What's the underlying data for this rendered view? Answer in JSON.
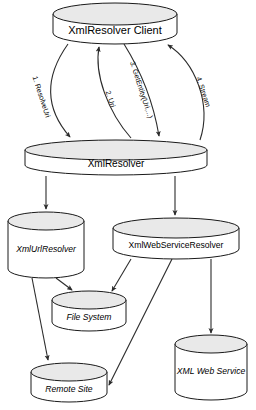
{
  "diagram": {
    "colors": {
      "cylinder_top_fill": "#e9e9e9",
      "cylinder_body_fill": "#ffffff",
      "stroke": "#1a1a1a",
      "edge_stroke": "#2b2b2b",
      "background": "#ffffff",
      "text": "#000000"
    },
    "nodes": [
      {
        "id": "client",
        "label": "XmlResolver Client",
        "style": "normal",
        "font_size": 11
      },
      {
        "id": "resolver",
        "label": "XmlResolver",
        "style": "normal",
        "font_size": 10
      },
      {
        "id": "urlresolver",
        "label": "XmlUrlResolver",
        "style": "italic",
        "font_size": 8.6
      },
      {
        "id": "wsresolver",
        "label": "XmlWebServiceResolver",
        "style": "normal",
        "font_size": 8.6
      },
      {
        "id": "filesystem",
        "label": "File System",
        "style": "italic",
        "font_size": 8.6
      },
      {
        "id": "remotesite",
        "label": "Remote Site",
        "style": "italic",
        "font_size": 8.6
      },
      {
        "id": "webservice",
        "label": "XML Web Service",
        "style": "italic",
        "font_size": 8.6
      }
    ],
    "edges": [
      {
        "id": "e1",
        "from": "client",
        "to": "resolver",
        "label": "1. ResolveUri"
      },
      {
        "id": "e2",
        "from": "resolver",
        "to": "client",
        "label": "2. Uri"
      },
      {
        "id": "e3",
        "from": "client",
        "to": "resolver",
        "label": "3. GetEntity(Uri,...)"
      },
      {
        "id": "e4",
        "from": "resolver",
        "to": "client",
        "label": "4. Stream"
      },
      {
        "id": "e5",
        "from": "resolver",
        "to": "urlresolver",
        "label": ""
      },
      {
        "id": "e6",
        "from": "resolver",
        "to": "wsresolver",
        "label": ""
      },
      {
        "id": "e7",
        "from": "urlresolver",
        "to": "filesystem",
        "label": ""
      },
      {
        "id": "e8",
        "from": "urlresolver",
        "to": "remotesite",
        "label": ""
      },
      {
        "id": "e9",
        "from": "wsresolver",
        "to": "filesystem",
        "label": ""
      },
      {
        "id": "e10",
        "from": "wsresolver",
        "to": "remotesite",
        "label": ""
      },
      {
        "id": "e11",
        "from": "wsresolver",
        "to": "webservice",
        "label": ""
      }
    ]
  }
}
